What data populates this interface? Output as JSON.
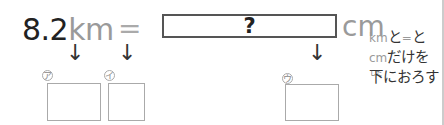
{
  "equation": {
    "value": "8.2",
    "from_unit": "km",
    "equals": "=",
    "answer": "?",
    "to_unit": "cm"
  },
  "arrows": {
    "glyph": "↓"
  },
  "boxes": [
    {
      "label": "ア"
    },
    {
      "label": "イ"
    },
    {
      "label": "ウ"
    }
  ],
  "note": {
    "line1_unit": "km",
    "line1_mid": "と",
    "line1_eq": "=",
    "line1_end": "と",
    "line2_unit": "cm",
    "line2_text": "だけを",
    "line3_kanji": "下",
    "line3_ruby": "した",
    "line3_text": "におろす"
  }
}
